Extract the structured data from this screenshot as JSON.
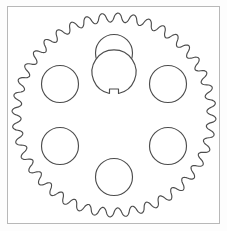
{
  "document": {
    "title": "Spur gear technical drawing",
    "background_color": "#fdfdfd",
    "frame_color": "#b8b8b8",
    "line_color": "#4d4d4d",
    "fill_color": "#ffffff"
  },
  "frame": {
    "x": 7,
    "y": 6,
    "width": 213,
    "height": 218
  },
  "drawing": {
    "type": "gear-technical-drawing",
    "view": "front-elevation",
    "center_x": 114,
    "center_y": 115,
    "gear": {
      "label": "spur-gear-body",
      "tooth_count": 40,
      "tip_radius": 102,
      "root_radius": 93,
      "tooth_profile": "rounded-sinusoidal",
      "phase_deg": -90
    },
    "center_bore": {
      "label": "center-bore",
      "radius": 22,
      "keyway": {
        "label": "keyway-notch",
        "shape": "rectangular",
        "position": "top",
        "width": 9,
        "depth": 7
      }
    },
    "lightening_holes": {
      "label": "lightening-holes",
      "count": 6,
      "bolt_circle_radius": 62,
      "hole_radius": 18.5,
      "start_angle_deg": -90,
      "holes": [
        {
          "name": "hole-top",
          "angle_deg": -90,
          "cx": 114,
          "cy": 53,
          "r": 18.5
        },
        {
          "name": "hole-upper-right",
          "angle_deg": -30,
          "cx": 168,
          "cy": 84,
          "r": 18.5
        },
        {
          "name": "hole-lower-right",
          "angle_deg": 30,
          "cx": 168,
          "cy": 146,
          "r": 18.5
        },
        {
          "name": "hole-bottom",
          "angle_deg": 90,
          "cx": 114,
          "cy": 177,
          "r": 18.5
        },
        {
          "name": "hole-lower-left",
          "angle_deg": 150,
          "cx": 60,
          "cy": 146,
          "r": 18.5
        },
        {
          "name": "hole-upper-left",
          "angle_deg": 210,
          "cx": 60,
          "cy": 84,
          "r": 18.5
        }
      ]
    }
  }
}
